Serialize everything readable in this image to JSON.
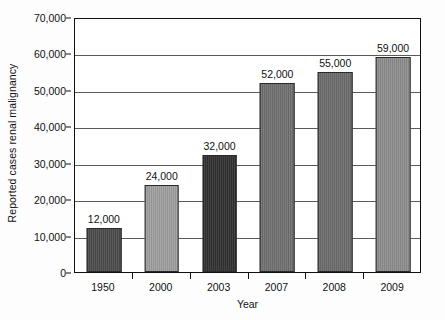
{
  "chart_data": {
    "type": "bar",
    "title": "",
    "xlabel": "Year",
    "ylabel": "Reported cases renal malignancy",
    "categories": [
      "1950",
      "2000",
      "2003",
      "2007",
      "2008",
      "2009"
    ],
    "values": [
      12000,
      24000,
      32000,
      52000,
      55000,
      59000
    ],
    "value_labels": [
      "12,000",
      "24,000",
      "32,000",
      "52,000",
      "55,000",
      "59,000"
    ],
    "ylim": [
      0,
      70000
    ],
    "ytick_values": [
      0,
      10000,
      20000,
      30000,
      40000,
      50000,
      60000,
      70000
    ],
    "ytick_labels": [
      "0",
      "10,000",
      "20,000",
      "30,000",
      "40,000",
      "50,000",
      "60,000",
      "70,000"
    ],
    "grid": true,
    "legend": "none",
    "bar_colors": [
      "#4a4a4a",
      "#9d9d9d",
      "#2f2f2f",
      "#6e6e6e",
      "#6a6a6a",
      "#8b8b8b"
    ]
  }
}
